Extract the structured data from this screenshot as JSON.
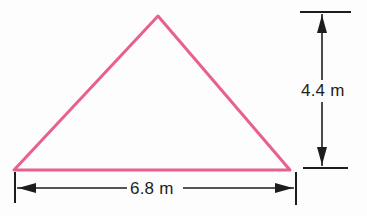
{
  "figure": {
    "background_color": "#fdfdfd",
    "shape": {
      "name": "triangle",
      "stroke_color": "#e8608c",
      "stroke_width": 3,
      "fill": "none",
      "vertices": [
        {
          "label": "left-vertex",
          "x": 14,
          "y": 170
        },
        {
          "label": "apex",
          "x": 158,
          "y": 16
        },
        {
          "label": "right-vertex",
          "x": 290,
          "y": 170
        }
      ]
    },
    "dimensions": [
      {
        "name": "base",
        "orientation": "horizontal",
        "value": "6.8",
        "unit": "m",
        "label": "6.8 m",
        "line_color": "#1d1d1d",
        "arrow_style": "double-headed-outward",
        "extension_ticks": [
          15,
          296
        ],
        "line_y": 188
      },
      {
        "name": "height",
        "orientation": "vertical",
        "value": "4.4",
        "unit": "m",
        "label": "4.4 m",
        "line_color": "#1d1d1d",
        "arrow_style": "double-headed-inward",
        "extension_caps_y": [
          12,
          168
        ],
        "line_x": 322
      }
    ]
  }
}
